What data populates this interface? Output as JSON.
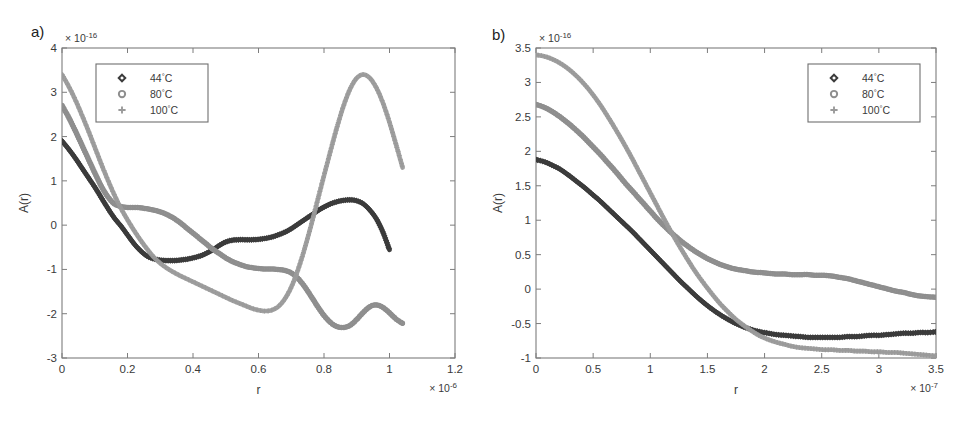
{
  "figure": {
    "background": "#ffffff",
    "panels": [
      {
        "tag": "a)"
      },
      {
        "tag": "b)"
      }
    ]
  },
  "series_colors": {
    "t44": "#3b3b3b",
    "t80": "#8e8e8e",
    "t100": "#9a9a9a"
  },
  "legend": {
    "entries": [
      {
        "marker": "diamond-marker",
        "glyph": "◇",
        "label": "44",
        "unit": "°C",
        "full": "44°C"
      },
      {
        "marker": "circle-marker",
        "glyph": "○",
        "label": "80",
        "unit": "°C",
        "full": "80°C"
      },
      {
        "marker": "plus-marker",
        "glyph": "+",
        "label": "100",
        "unit": "°C",
        "full": "100°C"
      }
    ]
  },
  "chart_data": [
    {
      "id": "panel-a",
      "type": "scatter",
      "title": "a)",
      "xlabel": "r",
      "ylabel": "A(r)",
      "x_exponent": "× 10",
      "x_exponent_power": "-6",
      "y_exponent": "× 10",
      "y_exponent_power": "-16",
      "xlim": [
        0,
        1.2
      ],
      "ylim": [
        -3,
        4
      ],
      "xticks": [
        "0",
        "0.2",
        "0.4",
        "0.6",
        "0.8",
        "1",
        "1.2"
      ],
      "xtick_values": [
        0,
        0.2,
        0.4,
        0.6,
        0.8,
        1,
        1.2
      ],
      "yticks": [
        "4",
        "3",
        "2",
        "1",
        "0",
        "-1",
        "-2",
        "-3"
      ],
      "ytick_values": [
        4,
        3,
        2,
        1,
        0,
        -1,
        -2,
        -3
      ],
      "grid": false,
      "legend_position": "top-left-inset",
      "series": [
        {
          "name": "44°C",
          "marker": "diamond",
          "color": "#3b3b3b",
          "x": [
            0.0,
            0.02,
            0.04,
            0.06,
            0.08,
            0.1,
            0.12,
            0.14,
            0.16,
            0.18,
            0.2,
            0.22,
            0.24,
            0.26,
            0.28,
            0.3,
            0.32,
            0.34,
            0.36,
            0.38,
            0.4,
            0.42,
            0.44,
            0.46,
            0.48,
            0.5,
            0.52,
            0.54,
            0.56,
            0.58,
            0.6,
            0.62,
            0.64,
            0.66,
            0.68,
            0.7,
            0.72,
            0.74,
            0.76,
            0.78,
            0.8,
            0.82,
            0.84,
            0.86,
            0.88,
            0.9,
            0.92,
            0.94,
            0.96,
            0.98,
            1.0
          ],
          "y": [
            1.9,
            1.72,
            1.52,
            1.3,
            1.08,
            0.86,
            0.62,
            0.38,
            0.16,
            -0.02,
            -0.22,
            -0.42,
            -0.58,
            -0.7,
            -0.76,
            -0.79,
            -0.8,
            -0.8,
            -0.79,
            -0.77,
            -0.74,
            -0.7,
            -0.64,
            -0.56,
            -0.46,
            -0.38,
            -0.34,
            -0.33,
            -0.33,
            -0.33,
            -0.32,
            -0.3,
            -0.27,
            -0.22,
            -0.16,
            -0.08,
            0.02,
            0.12,
            0.22,
            0.32,
            0.41,
            0.48,
            0.53,
            0.56,
            0.57,
            0.55,
            0.48,
            0.34,
            0.14,
            -0.16,
            -0.56,
            -0.95
          ]
        },
        {
          "name": "80°C",
          "marker": "circle",
          "color": "#8e8e8e",
          "x": [
            0.0,
            0.02,
            0.04,
            0.06,
            0.08,
            0.1,
            0.12,
            0.14,
            0.16,
            0.18,
            0.2,
            0.22,
            0.24,
            0.26,
            0.28,
            0.3,
            0.32,
            0.34,
            0.36,
            0.38,
            0.4,
            0.42,
            0.44,
            0.46,
            0.48,
            0.5,
            0.52,
            0.54,
            0.56,
            0.58,
            0.6,
            0.62,
            0.64,
            0.66,
            0.68,
            0.7,
            0.72,
            0.74,
            0.76,
            0.78,
            0.8,
            0.82,
            0.84,
            0.86,
            0.88,
            0.9,
            0.92,
            0.94,
            0.96,
            0.98,
            1.0,
            1.02,
            1.04
          ],
          "y": [
            2.7,
            2.44,
            2.14,
            1.82,
            1.5,
            1.18,
            0.88,
            0.64,
            0.48,
            0.42,
            0.4,
            0.4,
            0.39,
            0.37,
            0.34,
            0.3,
            0.24,
            0.16,
            0.06,
            -0.06,
            -0.18,
            -0.3,
            -0.42,
            -0.54,
            -0.64,
            -0.74,
            -0.82,
            -0.88,
            -0.93,
            -0.96,
            -0.98,
            -0.99,
            -0.99,
            -1.0,
            -1.02,
            -1.08,
            -1.2,
            -1.38,
            -1.6,
            -1.83,
            -2.04,
            -2.2,
            -2.29,
            -2.31,
            -2.26,
            -2.13,
            -1.97,
            -1.84,
            -1.8,
            -1.86,
            -1.98,
            -2.12,
            -2.22
          ]
        },
        {
          "name": "100°C",
          "marker": "plus",
          "color": "#9a9a9a",
          "x": [
            0.0,
            0.02,
            0.04,
            0.06,
            0.08,
            0.1,
            0.12,
            0.14,
            0.16,
            0.18,
            0.2,
            0.22,
            0.24,
            0.26,
            0.28,
            0.3,
            0.32,
            0.34,
            0.36,
            0.38,
            0.4,
            0.42,
            0.44,
            0.46,
            0.48,
            0.5,
            0.52,
            0.54,
            0.56,
            0.58,
            0.6,
            0.62,
            0.64,
            0.66,
            0.68,
            0.7,
            0.72,
            0.74,
            0.76,
            0.78,
            0.8,
            0.82,
            0.84,
            0.86,
            0.88,
            0.9,
            0.92,
            0.94,
            0.96,
            0.98,
            1.0,
            1.02,
            1.04
          ],
          "y": [
            3.4,
            3.14,
            2.84,
            2.5,
            2.14,
            1.76,
            1.38,
            1.02,
            0.68,
            0.38,
            0.12,
            -0.12,
            -0.34,
            -0.54,
            -0.72,
            -0.86,
            -0.97,
            -1.06,
            -1.14,
            -1.21,
            -1.28,
            -1.35,
            -1.42,
            -1.49,
            -1.56,
            -1.63,
            -1.7,
            -1.76,
            -1.82,
            -1.88,
            -1.92,
            -1.94,
            -1.92,
            -1.84,
            -1.67,
            -1.4,
            -1.02,
            -0.55,
            -0.02,
            0.55,
            1.12,
            1.68,
            2.22,
            2.7,
            3.08,
            3.32,
            3.4,
            3.32,
            3.1,
            2.76,
            2.32,
            1.82,
            1.3,
            0.72
          ]
        }
      ]
    },
    {
      "id": "panel-b",
      "type": "scatter",
      "title": "b)",
      "xlabel": "r",
      "ylabel": "A(r)",
      "x_exponent": "× 10",
      "x_exponent_power": "-7",
      "y_exponent": "× 10",
      "y_exponent_power": "-16",
      "xlim": [
        0,
        3.5
      ],
      "ylim": [
        -1,
        3.5
      ],
      "xticks": [
        "0",
        "0.5",
        "1",
        "1.5",
        "2",
        "2.5",
        "3",
        "3.5"
      ],
      "xtick_values": [
        0,
        0.5,
        1,
        1.5,
        2,
        2.5,
        3,
        3.5
      ],
      "yticks": [
        "3.5",
        "3",
        "2.5",
        "2",
        "1.5",
        "1",
        "0.5",
        "0",
        "-0.5",
        "-1"
      ],
      "ytick_values": [
        3.5,
        3,
        2.5,
        2,
        1.5,
        1,
        0.5,
        0,
        -0.5,
        -1
      ],
      "grid": false,
      "legend_position": "top-right-inset",
      "series": [
        {
          "name": "44°C",
          "marker": "diamond",
          "color": "#3b3b3b",
          "x": [
            0.0,
            0.07,
            0.14,
            0.21,
            0.28,
            0.35,
            0.42,
            0.49,
            0.56,
            0.63,
            0.7,
            0.77,
            0.84,
            0.91,
            0.98,
            1.05,
            1.12,
            1.19,
            1.26,
            1.33,
            1.4,
            1.47,
            1.54,
            1.61,
            1.68,
            1.75,
            1.82,
            1.89,
            1.96,
            2.03,
            2.1,
            2.17,
            2.24,
            2.31,
            2.38,
            2.45,
            2.52,
            2.59,
            2.66,
            2.73,
            2.8,
            2.87,
            2.94,
            3.01,
            3.08,
            3.15,
            3.22,
            3.29,
            3.36,
            3.43,
            3.5
          ],
          "y": [
            1.88,
            1.85,
            1.8,
            1.74,
            1.66,
            1.57,
            1.48,
            1.38,
            1.28,
            1.17,
            1.06,
            0.95,
            0.84,
            0.72,
            0.6,
            0.48,
            0.36,
            0.24,
            0.12,
            0.01,
            -0.1,
            -0.2,
            -0.29,
            -0.37,
            -0.44,
            -0.5,
            -0.55,
            -0.59,
            -0.62,
            -0.64,
            -0.66,
            -0.67,
            -0.68,
            -0.69,
            -0.7,
            -0.7,
            -0.7,
            -0.7,
            -0.7,
            -0.69,
            -0.69,
            -0.68,
            -0.67,
            -0.67,
            -0.66,
            -0.65,
            -0.64,
            -0.64,
            -0.63,
            -0.63,
            -0.62
          ]
        },
        {
          "name": "80°C",
          "marker": "circle",
          "color": "#8e8e8e",
          "x": [
            0.0,
            0.07,
            0.14,
            0.21,
            0.28,
            0.35,
            0.42,
            0.49,
            0.56,
            0.63,
            0.7,
            0.77,
            0.84,
            0.91,
            0.98,
            1.05,
            1.12,
            1.19,
            1.26,
            1.33,
            1.4,
            1.47,
            1.54,
            1.61,
            1.68,
            1.75,
            1.82,
            1.89,
            1.96,
            2.03,
            2.1,
            2.17,
            2.24,
            2.31,
            2.38,
            2.45,
            2.52,
            2.59,
            2.66,
            2.73,
            2.8,
            2.87,
            2.94,
            3.01,
            3.08,
            3.15,
            3.22,
            3.29,
            3.36,
            3.43,
            3.5
          ],
          "y": [
            2.68,
            2.64,
            2.58,
            2.5,
            2.41,
            2.31,
            2.2,
            2.08,
            1.96,
            1.83,
            1.7,
            1.56,
            1.43,
            1.3,
            1.17,
            1.04,
            0.92,
            0.81,
            0.71,
            0.62,
            0.54,
            0.47,
            0.41,
            0.36,
            0.32,
            0.29,
            0.27,
            0.25,
            0.24,
            0.23,
            0.22,
            0.22,
            0.21,
            0.21,
            0.21,
            0.2,
            0.2,
            0.19,
            0.17,
            0.15,
            0.12,
            0.09,
            0.06,
            0.03,
            0.0,
            -0.03,
            -0.05,
            -0.08,
            -0.1,
            -0.11,
            -0.12
          ]
        },
        {
          "name": "100°C",
          "marker": "plus",
          "color": "#9a9a9a",
          "x": [
            0.0,
            0.07,
            0.14,
            0.21,
            0.28,
            0.35,
            0.42,
            0.49,
            0.56,
            0.63,
            0.7,
            0.77,
            0.84,
            0.91,
            0.98,
            1.05,
            1.12,
            1.19,
            1.26,
            1.33,
            1.4,
            1.47,
            1.54,
            1.61,
            1.68,
            1.75,
            1.82,
            1.89,
            1.96,
            2.03,
            2.1,
            2.17,
            2.24,
            2.31,
            2.38,
            2.45,
            2.52,
            2.59,
            2.66,
            2.73,
            2.8,
            2.87,
            2.94,
            3.01,
            3.08,
            3.15,
            3.22,
            3.29,
            3.36,
            3.43,
            3.5
          ],
          "y": [
            3.4,
            3.38,
            3.34,
            3.28,
            3.2,
            3.1,
            2.98,
            2.84,
            2.68,
            2.5,
            2.31,
            2.11,
            1.9,
            1.68,
            1.46,
            1.24,
            1.02,
            0.81,
            0.61,
            0.42,
            0.24,
            0.08,
            -0.07,
            -0.21,
            -0.33,
            -0.44,
            -0.53,
            -0.61,
            -0.68,
            -0.73,
            -0.77,
            -0.8,
            -0.83,
            -0.85,
            -0.86,
            -0.87,
            -0.88,
            -0.88,
            -0.89,
            -0.89,
            -0.9,
            -0.9,
            -0.91,
            -0.91,
            -0.92,
            -0.92,
            -0.93,
            -0.94,
            -0.95,
            -0.96,
            -0.97
          ]
        }
      ]
    }
  ]
}
